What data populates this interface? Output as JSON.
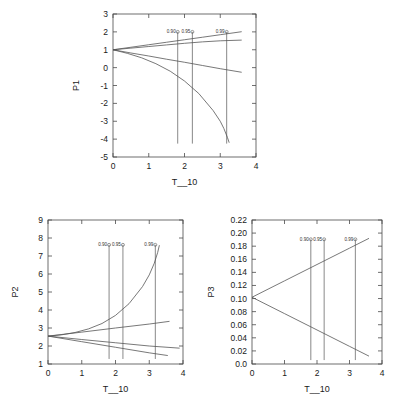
{
  "figure": {
    "panel_count": 3,
    "conf_labels": [
      "0.90",
      "0.95",
      "0.99"
    ]
  },
  "chart_data": [
    {
      "id": "p1",
      "type": "line",
      "title": "",
      "xlabel": "T__10",
      "ylabel": "P1",
      "xlim": [
        0,
        4
      ],
      "ylim": [
        -5,
        3
      ],
      "xticks": [
        0,
        1,
        2,
        3,
        4
      ],
      "xticklabels": [
        "0",
        "1",
        "2",
        "3",
        "4"
      ],
      "yticks": [
        -5,
        -4,
        -3,
        -2,
        -1,
        0,
        1,
        2,
        3
      ],
      "yticklabels": [
        "-5",
        "-4",
        "-3",
        "-2",
        "-1",
        "0",
        "1",
        "2",
        "3"
      ],
      "grid": false,
      "legend": "none",
      "origin": [
        0,
        1
      ],
      "series": [
        {
          "name": "upper-band",
          "x": [
            0,
            0.5,
            1.0,
            1.5,
            2.0,
            2.5,
            3.0,
            3.6
          ],
          "values": [
            1.0,
            1.14,
            1.28,
            1.42,
            1.56,
            1.7,
            1.84,
            2.01
          ]
        },
        {
          "name": "mid-band",
          "x": [
            0,
            0.5,
            1.0,
            1.5,
            2.0,
            2.5,
            3.0,
            3.6
          ],
          "values": [
            1.0,
            1.09,
            1.18,
            1.27,
            1.36,
            1.44,
            1.5,
            1.54
          ]
        },
        {
          "name": "lower-band",
          "x": [
            0,
            0.5,
            1.0,
            1.5,
            2.0,
            2.5,
            3.0,
            3.6
          ],
          "values": [
            1.0,
            0.82,
            0.65,
            0.47,
            0.3,
            0.12,
            -0.06,
            -0.26
          ]
        },
        {
          "name": "decay-curve",
          "x": [
            0,
            0.4,
            0.8,
            1.2,
            1.6,
            2.0,
            2.4,
            2.8,
            3.0,
            3.1,
            3.2,
            3.25
          ],
          "values": [
            1.0,
            0.8,
            0.55,
            0.22,
            -0.2,
            -0.75,
            -1.45,
            -2.4,
            -3.0,
            -3.4,
            -3.9,
            -4.2
          ]
        }
      ],
      "conf_lines": [
        {
          "label": "0.90",
          "x": 1.81,
          "y_top": 2.0,
          "y_bottom": -4.25
        },
        {
          "label": "0.95",
          "x": 2.22,
          "y_top": 2.0,
          "y_bottom": -4.25
        },
        {
          "label": "0.99",
          "x": 3.18,
          "y_top": 2.0,
          "y_bottom": -4.25
        }
      ]
    },
    {
      "id": "p2",
      "type": "line",
      "title": "",
      "xlabel": "T__10",
      "ylabel": "P2",
      "xlim": [
        0,
        4
      ],
      "ylim": [
        1,
        9
      ],
      "xticks": [
        0,
        1,
        2,
        3,
        4
      ],
      "xticklabels": [
        "0",
        "1",
        "2",
        "3",
        "4"
      ],
      "yticks": [
        1,
        2,
        3,
        4,
        5,
        6,
        7,
        8,
        9
      ],
      "yticklabels": [
        "1",
        "2",
        "3",
        "4",
        "5",
        "6",
        "7",
        "8",
        "9"
      ],
      "grid": false,
      "legend": "none",
      "origin": [
        0,
        2.55
      ],
      "series": [
        {
          "name": "growth-curve",
          "x": [
            0,
            0.4,
            0.8,
            1.2,
            1.6,
            2.0,
            2.4,
            2.8,
            3.0,
            3.15,
            3.25,
            3.3
          ],
          "values": [
            2.55,
            2.62,
            2.75,
            2.95,
            3.25,
            3.7,
            4.35,
            5.3,
            5.95,
            6.6,
            7.2,
            7.6
          ]
        },
        {
          "name": "upper-band",
          "x": [
            0,
            1.0,
            2.0,
            3.0,
            3.6
          ],
          "values": [
            2.55,
            2.77,
            3.0,
            3.22,
            3.37
          ]
        },
        {
          "name": "mid-band",
          "x": [
            0,
            1.0,
            2.0,
            3.0,
            3.9
          ],
          "values": [
            2.55,
            2.36,
            2.18,
            2.0,
            1.88
          ]
        },
        {
          "name": "lower-band",
          "x": [
            0,
            1.0,
            2.0,
            3.0,
            3.55
          ],
          "values": [
            2.55,
            2.24,
            1.93,
            1.62,
            1.47
          ]
        }
      ],
      "conf_lines": [
        {
          "label": "0.90",
          "x": 1.81,
          "y_top": 7.62,
          "y_bottom": 1.28
        },
        {
          "label": "0.95",
          "x": 2.22,
          "y_top": 7.62,
          "y_bottom": 1.28
        },
        {
          "label": "0.99",
          "x": 3.18,
          "y_top": 7.62,
          "y_bottom": 1.28
        }
      ]
    },
    {
      "id": "p3",
      "type": "line",
      "title": "",
      "xlabel": "T__10",
      "ylabel": "P3",
      "xlim": [
        0,
        4
      ],
      "ylim": [
        0.0,
        0.22
      ],
      "xticks": [
        0,
        1,
        2,
        3,
        4
      ],
      "xticklabels": [
        "0",
        "1",
        "2",
        "3",
        "4"
      ],
      "yticks": [
        0.0,
        0.02,
        0.04,
        0.06,
        0.08,
        0.1,
        0.12,
        0.14,
        0.16,
        0.18,
        0.2,
        0.22
      ],
      "yticklabels": [
        "0.0",
        "0.02",
        "0.04",
        "0.06",
        "0.08",
        "0.10",
        "0.12",
        "0.14",
        "0.16",
        "0.18",
        "0.20",
        "0.22"
      ],
      "grid": false,
      "legend": "none",
      "origin": [
        0,
        0.102
      ],
      "series": [
        {
          "name": "rising-band",
          "x": [
            0,
            1.0,
            2.0,
            3.0,
            3.6
          ],
          "values": [
            0.102,
            0.127,
            0.152,
            0.177,
            0.192
          ]
        },
        {
          "name": "falling-band",
          "x": [
            0,
            1.0,
            2.0,
            3.0,
            3.6
          ],
          "values": [
            0.102,
            0.077,
            0.052,
            0.027,
            0.012
          ]
        }
      ],
      "conf_lines": [
        {
          "label": "0.90",
          "x": 1.81,
          "y_top": 0.1905,
          "y_bottom": 0.006
        },
        {
          "label": "0.95",
          "x": 2.22,
          "y_top": 0.1905,
          "y_bottom": 0.006
        },
        {
          "label": "0.99",
          "x": 3.18,
          "y_top": 0.1905,
          "y_bottom": 0.006
        }
      ]
    }
  ]
}
